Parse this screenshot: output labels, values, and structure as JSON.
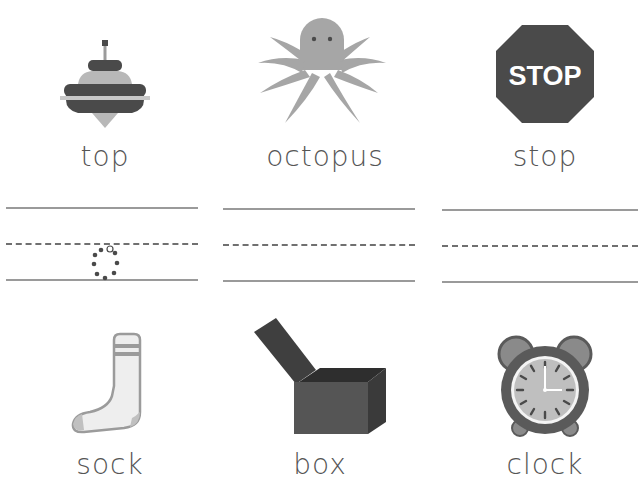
{
  "worksheet": {
    "top_row": [
      {
        "word": "top",
        "picture": "spinning-top"
      },
      {
        "word": "octopus",
        "picture": "octopus"
      },
      {
        "word": "stop",
        "picture": "stop-sign",
        "sign_text": "STOP"
      }
    ],
    "bottom_row": [
      {
        "word": "sock",
        "picture": "sock"
      },
      {
        "word": "box",
        "picture": "box"
      },
      {
        "word": "clock",
        "picture": "alarm-clock"
      }
    ],
    "writing_lines": {
      "count": 3,
      "trace_hint": "dotted letter o"
    }
  },
  "colors": {
    "dark": "#4a4a4a",
    "mid": "#9b9b9b",
    "light": "#c8c8c8",
    "line": "#9a9a9a"
  }
}
